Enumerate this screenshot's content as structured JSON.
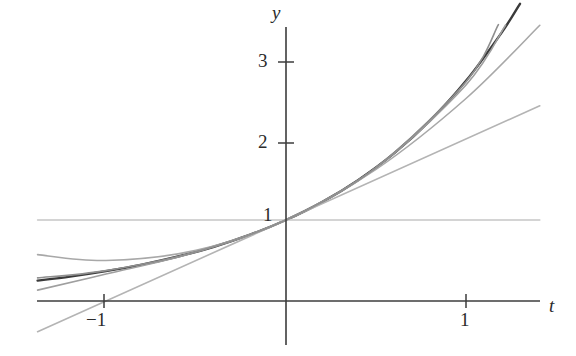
{
  "figure": {
    "kind": "math-plot",
    "background": "#ffffff"
  },
  "axes": {
    "x_axis_label": "t",
    "y_axis_label": "y",
    "x_ticks": [
      {
        "value": -1,
        "label": "−1",
        "px": 104
      },
      {
        "value": 1,
        "label": "1",
        "px": 466
      }
    ],
    "y_ticks": [
      {
        "value": 1,
        "label": "1",
        "px": 216
      },
      {
        "value": 2,
        "label": "2",
        "px": 143
      },
      {
        "value": 3,
        "label": "3",
        "px": 62
      }
    ],
    "origin_px": {
      "x": 286,
      "y": 301
    },
    "x_unit_px": 180,
    "y_unit_px": 81,
    "x_axis_line": {
      "x1": 37,
      "x2": 540,
      "y": 301
    },
    "y_axis_line": {
      "x": 286,
      "y1": 27,
      "y2": 345
    },
    "axis_color": "#3c3c3c"
  },
  "chart_data": {
    "type": "line",
    "title": "",
    "xlabel": "t",
    "ylabel": "y",
    "xlim": [
      -1.38,
      1.41
    ],
    "ylim": [
      -0.55,
      3.38
    ],
    "grid": false,
    "legend": "none",
    "x_tick_labels": [
      "−1",
      "1"
    ],
    "y_tick_labels": [
      "1",
      "2",
      "3"
    ],
    "series": [
      {
        "name": "e^t",
        "expression": "y = e^t",
        "color": "#3a3a3a",
        "width": 2.4,
        "x": [
          -1.38,
          -1.2,
          -1.0,
          -0.8,
          -0.6,
          -0.4,
          -0.2,
          0.0,
          0.2,
          0.4,
          0.6,
          0.8,
          1.0,
          1.2,
          1.3
        ],
        "y": [
          0.252,
          0.301,
          0.368,
          0.449,
          0.549,
          0.67,
          0.819,
          1.0,
          1.221,
          1.492,
          1.822,
          2.226,
          2.718,
          3.32,
          3.669
        ]
      },
      {
        "name": "T0",
        "expression": "y = 1",
        "color": "#c6c6c6",
        "width": 1.6,
        "x": [
          -1.38,
          1.41
        ],
        "y": [
          1.0,
          1.0
        ]
      },
      {
        "name": "T1",
        "expression": "y = 1 + t",
        "color": "#b4b4b4",
        "width": 1.6,
        "x": [
          -1.38,
          1.41
        ],
        "y": [
          -0.38,
          2.41
        ]
      },
      {
        "name": "T2",
        "expression": "y = 1 + t + t²/2",
        "color": "#a8a8a8",
        "width": 1.6,
        "x": [
          -1.38,
          -1.0,
          -0.5,
          0.0,
          0.5,
          1.0,
          1.41
        ],
        "y": [
          0.572,
          0.5,
          0.625,
          1.0,
          1.625,
          2.5,
          3.404
        ]
      },
      {
        "name": "T3",
        "expression": "y = 1 + t + t²/2 + t³/6",
        "color": "#9f9f9f",
        "width": 1.6,
        "x": [
          -1.38,
          -1.0,
          -0.5,
          0.0,
          0.5,
          1.0,
          1.22
        ],
        "y": [
          0.134,
          0.333,
          0.604,
          1.0,
          1.646,
          2.667,
          3.407
        ]
      },
      {
        "name": "T4",
        "expression": "y = 1 + t + t²/2 + t³/6 + t⁴/24",
        "color": "#8f8f8f",
        "width": 1.6,
        "x": [
          -1.38,
          -1.0,
          -0.5,
          0.0,
          0.5,
          1.0,
          1.18
        ],
        "y": [
          0.285,
          0.375,
          0.607,
          1.0,
          1.648,
          2.708,
          3.411
        ]
      }
    ],
    "annotations": []
  }
}
